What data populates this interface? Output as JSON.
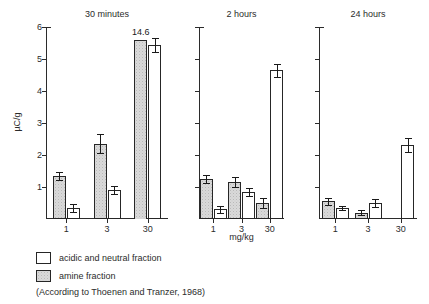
{
  "chart_data": {
    "type": "bar",
    "title": "",
    "ylabel": "µC/g",
    "xlabel": "mg/kg",
    "ylim": [
      0,
      6
    ],
    "ytick_labels": [
      "1",
      "2",
      "3",
      "4",
      "5",
      "6"
    ],
    "ytick_values": [
      1,
      2,
      3,
      4,
      5,
      6
    ],
    "grid": false,
    "legend_position": "below-left",
    "categories": [
      "1",
      "3",
      "30"
    ],
    "panels": [
      {
        "title": "30 minutes",
        "yaxis_labeled": true,
        "series": [
          {
            "name": "amine fraction",
            "values": [
              1.35,
              2.35,
              5.6
            ],
            "errors": [
              0.12,
              0.3,
              0.0
            ],
            "value_labels": [
              "",
              "",
              "14.6"
            ],
            "truncated": [
              false,
              false,
              true
            ]
          },
          {
            "name": "acidic and neutral fraction",
            "values": [
              0.35,
              0.9,
              5.45
            ],
            "errors": [
              0.12,
              0.12,
              0.22
            ],
            "value_labels": [
              "",
              "",
              ""
            ],
            "truncated": [
              false,
              false,
              false
            ]
          }
        ]
      },
      {
        "title": "2 hours",
        "yaxis_labeled": false,
        "series": [
          {
            "name": "amine fraction",
            "values": [
              1.25,
              1.15,
              0.5
            ],
            "errors": [
              0.13,
              0.15,
              0.15
            ],
            "value_labels": [
              "",
              "",
              ""
            ],
            "truncated": [
              false,
              false,
              false
            ]
          },
          {
            "name": "acidic and neutral fraction",
            "values": [
              0.3,
              0.85,
              4.65
            ],
            "errors": [
              0.1,
              0.12,
              0.2
            ],
            "value_labels": [
              "",
              "",
              ""
            ],
            "truncated": [
              false,
              false,
              false
            ]
          }
        ]
      },
      {
        "title": "24 hours",
        "yaxis_labeled": false,
        "series": [
          {
            "name": "amine fraction",
            "values": [
              0.55,
              0.2,
              0.0
            ],
            "errors": [
              0.1,
              0.07,
              0.0
            ],
            "value_labels": [
              "",
              "",
              ""
            ],
            "truncated": [
              false,
              false,
              false
            ]
          },
          {
            "name": "acidic and neutral fraction",
            "values": [
              0.35,
              0.5,
              2.3
            ],
            "errors": [
              0.07,
              0.12,
              0.22
            ],
            "value_labels": [
              "",
              "",
              ""
            ],
            "truncated": [
              false,
              false,
              false
            ]
          }
        ]
      }
    ]
  },
  "legend": {
    "items": [
      {
        "label": "acidic and neutral fraction",
        "key": "acidic",
        "color": "#ffffff"
      },
      {
        "label": "amine fraction",
        "key": "amine",
        "color": "#d9d9d9"
      }
    ]
  },
  "source_note": "(According to Thoenen and Tranzer, 1968)"
}
